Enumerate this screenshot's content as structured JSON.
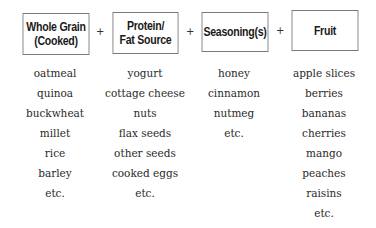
{
  "headers": [
    {
      "label_line1": "Whole Grain",
      "label_line2": "(Cooked)"
    },
    {
      "label_line1": "Protein/",
      "label_line2": "Fat Source"
    },
    {
      "label_line1": "Seasoning(s)",
      "label_line2": ""
    },
    {
      "label_line1": "Fruit",
      "label_line2": ""
    }
  ],
  "operator": "+",
  "columns": [
    {
      "items": [
        "oatmeal",
        "quinoa",
        "buckwheat",
        "millet",
        "rice",
        "barley",
        "etc."
      ]
    },
    {
      "items": [
        "yogurt",
        "cottage cheese",
        "nuts",
        "flax seeds",
        "other seeds",
        "cooked eggs",
        "etc."
      ]
    },
    {
      "items": [
        "honey",
        "cinnamon",
        "nutmeg",
        "etc."
      ]
    },
    {
      "items": [
        "apple slices",
        "berries",
        "bananas",
        "cherries",
        "mango",
        "peaches",
        "raisins",
        "etc."
      ]
    }
  ]
}
